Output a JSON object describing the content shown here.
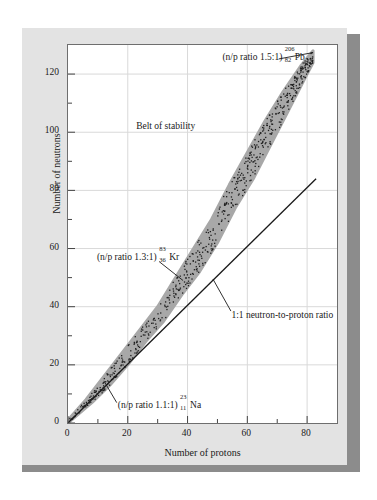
{
  "figure": {
    "panel_bg": "#e3e3e3",
    "shadow_color": "#8c8c8c",
    "plot_bg": "#ffffff",
    "belt_fill": "#a8a8a8",
    "gridline_color": "#d9d9d9",
    "line_color": "#1a1a1a"
  },
  "chart_data": {
    "type": "scatter",
    "title": "",
    "xlabel": "Number of protons",
    "ylabel": "Number of neutrons",
    "xlim": [
      0,
      90
    ],
    "ylim": [
      0,
      130
    ],
    "grid": true,
    "legend": "none",
    "x_major_ticks": [
      0,
      20,
      40,
      60,
      80
    ],
    "x_minor_ticks": [
      10,
      30,
      50,
      70
    ],
    "y_major_ticks": [
      0,
      20,
      40,
      60,
      80,
      100,
      120
    ],
    "y_minor_ticks": [
      10,
      30,
      50,
      70,
      90,
      110
    ],
    "x_tick_labels": [
      "0",
      "20",
      "40",
      "60",
      "80"
    ],
    "y_tick_labels": [
      "0",
      "20",
      "40",
      "60",
      "80",
      "100",
      "120"
    ],
    "series": [
      {
        "name": "Belt of stability",
        "kind": "band",
        "description": "Shaded band of stable nuclides, widening and curving above the 1:1 line as atomic number increases",
        "lower_boundary": [
          [
            0,
            0
          ],
          [
            8,
            7
          ],
          [
            14,
            13
          ],
          [
            20,
            20
          ],
          [
            26,
            28
          ],
          [
            32,
            35
          ],
          [
            38,
            44
          ],
          [
            44,
            52
          ],
          [
            50,
            62
          ],
          [
            56,
            74
          ],
          [
            62,
            84
          ],
          [
            68,
            96
          ],
          [
            74,
            108
          ],
          [
            79,
            118
          ],
          [
            82,
            124
          ]
        ],
        "upper_boundary": [
          [
            0,
            1
          ],
          [
            6,
            8
          ],
          [
            12,
            16
          ],
          [
            18,
            24
          ],
          [
            24,
            32
          ],
          [
            30,
            40
          ],
          [
            36,
            50
          ],
          [
            42,
            60
          ],
          [
            48,
            70
          ],
          [
            54,
            82
          ],
          [
            60,
            93
          ],
          [
            66,
            104
          ],
          [
            72,
            114
          ],
          [
            78,
            123
          ],
          [
            82,
            128
          ]
        ]
      },
      {
        "name": "1:1 neutron-to-proton ratio",
        "kind": "line",
        "points": [
          [
            0,
            0
          ],
          [
            83,
            84
          ]
        ]
      }
    ],
    "annotations": [
      {
        "id": "belt-of-stability",
        "text": "Belt of stability",
        "x": 33,
        "y": 101
      },
      {
        "id": "pb-206",
        "prefix": "(n/p ratio 1.5:1)",
        "mass_number": "206",
        "atomic_number": "82",
        "element": "Pb",
        "x": 52,
        "y": 125,
        "has_leader_line": true
      },
      {
        "id": "kr-83",
        "prefix": "(n/p ratio 1.3:1)",
        "mass_number": "83",
        "atomic_number": "36",
        "element": "Kr",
        "x": 10,
        "y": 56,
        "has_leader_line": true
      },
      {
        "id": "na-23",
        "prefix": "(n/p ratio 1.1:1)",
        "mass_number": "23",
        "atomic_number": "11",
        "element": "Na",
        "x": 17,
        "y": 5,
        "has_leader_line": true
      },
      {
        "id": "one-to-one-ratio",
        "text": "1:1 neutron-to-proton ratio",
        "x": 55,
        "y": 36,
        "has_leader_line": true
      }
    ]
  }
}
